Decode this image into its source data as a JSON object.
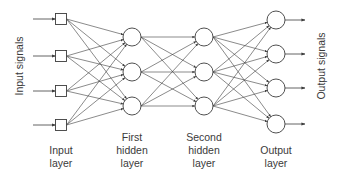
{
  "diagram": {
    "type": "feedforward-neural-network",
    "colors": {
      "line": "#3c3c3c",
      "text": "#3a3a3a",
      "node_fill": "#ffffff"
    },
    "side_labels": {
      "left": "Input signals",
      "right": "Output signals"
    },
    "layers": [
      {
        "id": "input",
        "label_lines": [
          "Input",
          "layer"
        ],
        "shape": "square",
        "x": 61,
        "nodes_y": [
          19,
          56,
          91,
          125
        ]
      },
      {
        "id": "hidden1",
        "label_lines": [
          "First",
          "hidden",
          "layer"
        ],
        "shape": "circle",
        "x": 132,
        "nodes_y": [
          37,
          72,
          106
        ]
      },
      {
        "id": "hidden2",
        "label_lines": [
          "Second",
          "hidden",
          "layer"
        ],
        "shape": "circle",
        "x": 204,
        "nodes_y": [
          37,
          72,
          106
        ]
      },
      {
        "id": "output",
        "label_lines": [
          "Output",
          "layer"
        ],
        "shape": "circle",
        "x": 276,
        "nodes_y": [
          20,
          54,
          88,
          124
        ]
      }
    ],
    "connectivity": "fully-connected between adjacent layers, arrows pointing right",
    "input_arrow_start_x": 33,
    "output_arrow_end_x": 305
  }
}
